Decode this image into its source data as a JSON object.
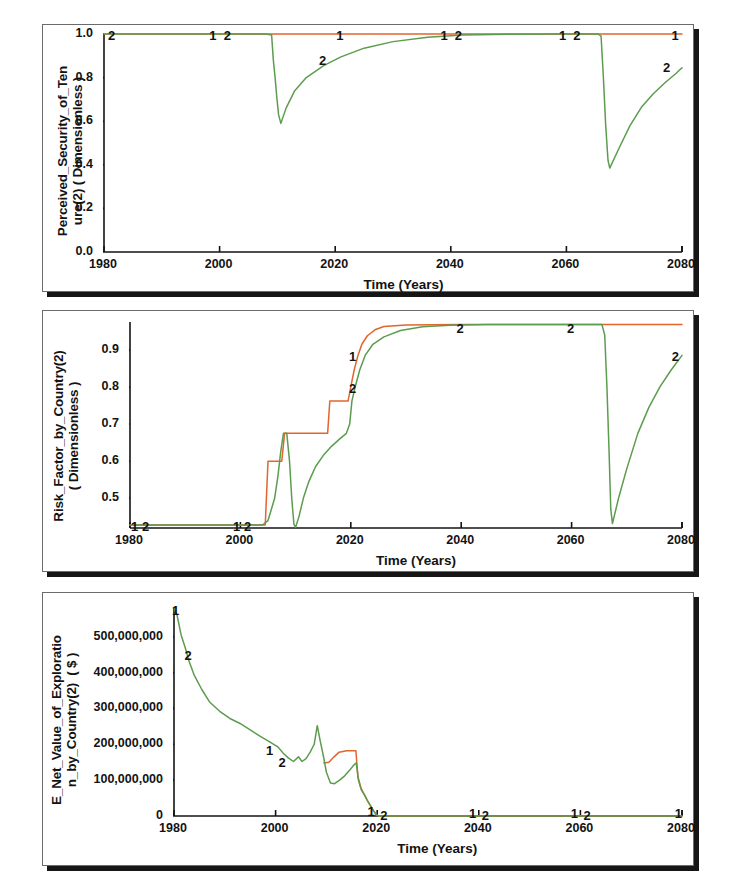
{
  "page": {
    "background": "#ffffff",
    "panel_count": 3
  },
  "colors": {
    "series1": "#e2652c",
    "series2": "#5c9c4e",
    "axis": "#131313",
    "panel_border": "#6b6b6b",
    "panel_shadow": "#161616"
  },
  "chart_data": [
    {
      "type": "line",
      "title": "",
      "ylabel": "Perceived_Security_of_Ten\nure(2) ( Dimensionless )",
      "xlabel": "Time (Years)",
      "xlim": [
        1980,
        2080
      ],
      "ylim": [
        0.0,
        1.0
      ],
      "xticks": [
        1980,
        2000,
        2020,
        2040,
        2060,
        2080
      ],
      "yticks": [
        "0.0",
        "0.2",
        "0.4",
        "0.6",
        "0.8",
        "1.0"
      ],
      "grid": false,
      "legend": "inline-numbered",
      "series": [
        {
          "name": "1",
          "color": "#e2652c",
          "points": [
            [
              1980,
              1.0
            ],
            [
              2000,
              1.0
            ],
            [
              2009,
              1.0
            ],
            [
              2020,
              1.0
            ],
            [
              2040,
              1.0
            ],
            [
              2060,
              1.0
            ],
            [
              2066,
              1.0
            ],
            [
              2080,
              1.0
            ]
          ]
        },
        {
          "name": "2",
          "color": "#5c9c4e",
          "points": [
            [
              1980,
              1.0
            ],
            [
              2000,
              1.0
            ],
            [
              2008,
              1.0
            ],
            [
              2009.0,
              0.995
            ],
            [
              2009.3,
              0.88
            ],
            [
              2009.6,
              0.8
            ],
            [
              2009.9,
              0.71
            ],
            [
              2010.2,
              0.63
            ],
            [
              2010.6,
              0.59
            ],
            [
              2011.5,
              0.66
            ],
            [
              2013,
              0.74
            ],
            [
              2015,
              0.8
            ],
            [
              2018,
              0.855
            ],
            [
              2021,
              0.895
            ],
            [
              2025,
              0.935
            ],
            [
              2030,
              0.965
            ],
            [
              2036,
              0.985
            ],
            [
              2042,
              0.995
            ],
            [
              2050,
              0.999
            ],
            [
              2060,
              1.0
            ],
            [
              2065.5,
              1.0
            ],
            [
              2066.0,
              0.99
            ],
            [
              2066.4,
              0.8
            ],
            [
              2066.8,
              0.58
            ],
            [
              2067.2,
              0.42
            ],
            [
              2067.5,
              0.385
            ],
            [
              2069,
              0.47
            ],
            [
              2071,
              0.58
            ],
            [
              2073,
              0.665
            ],
            [
              2075,
              0.725
            ],
            [
              2077,
              0.775
            ],
            [
              2079,
              0.82
            ],
            [
              2080,
              0.845
            ]
          ]
        }
      ],
      "annotations": [
        {
          "text": "2",
          "x": 1981.5,
          "y": 1.0
        },
        {
          "text": "1",
          "x": 1999.0,
          "y": 1.0
        },
        {
          "text": "2",
          "x": 2001.5,
          "y": 1.0
        },
        {
          "text": "1",
          "x": 2021.0,
          "y": 1.0
        },
        {
          "text": "2",
          "x": 2018.0,
          "y": 0.885
        },
        {
          "text": "1",
          "x": 2039.0,
          "y": 1.0
        },
        {
          "text": "2",
          "x": 2041.5,
          "y": 1.0
        },
        {
          "text": "1",
          "x": 2059.5,
          "y": 1.0
        },
        {
          "text": "2",
          "x": 2062.0,
          "y": 1.0
        },
        {
          "text": "1",
          "x": 2079.0,
          "y": 1.0
        },
        {
          "text": "2",
          "x": 2077.5,
          "y": 0.855
        }
      ]
    },
    {
      "type": "line",
      "title": "",
      "ylabel": "Risk_Factor_by_Country(2)\n( Dimensionless )",
      "xlabel": "Time (Years)",
      "xlim": [
        1980,
        2080
      ],
      "ylim": [
        0.42,
        0.975
      ],
      "xticks": [
        1980,
        2000,
        2020,
        2040,
        2060,
        2080
      ],
      "yticks": [
        "0.5",
        "0.6",
        "0.7",
        "0.8",
        "0.9"
      ],
      "grid": false,
      "legend": "inline-numbered",
      "series": [
        {
          "name": "1",
          "color": "#e2652c",
          "points": [
            [
              1980,
              0.428
            ],
            [
              2000,
              0.428
            ],
            [
              2004.5,
              0.428
            ],
            [
              2005,
              0.6
            ],
            [
              2007.5,
              0.6
            ],
            [
              2008,
              0.675
            ],
            [
              2015.8,
              0.675
            ],
            [
              2016.2,
              0.762
            ],
            [
              2019.5,
              0.762
            ],
            [
              2020,
              0.8
            ],
            [
              2020.6,
              0.845
            ],
            [
              2021.3,
              0.885
            ],
            [
              2022,
              0.915
            ],
            [
              2023,
              0.938
            ],
            [
              2024.5,
              0.955
            ],
            [
              2026,
              0.963
            ],
            [
              2030,
              0.967
            ],
            [
              2040,
              0.968
            ],
            [
              2060,
              0.968
            ],
            [
              2080,
              0.968
            ]
          ]
        },
        {
          "name": "2",
          "color": "#5c9c4e",
          "points": [
            [
              1980,
              0.428
            ],
            [
              2000,
              0.428
            ],
            [
              2004,
              0.428
            ],
            [
              2005,
              0.44
            ],
            [
              2005.6,
              0.47
            ],
            [
              2006.2,
              0.5
            ],
            [
              2006.8,
              0.56
            ],
            [
              2007.3,
              0.625
            ],
            [
              2007.8,
              0.675
            ],
            [
              2008.4,
              0.675
            ],
            [
              2008.9,
              0.6
            ],
            [
              2009.3,
              0.5
            ],
            [
              2009.7,
              0.43
            ],
            [
              2010.0,
              0.422
            ],
            [
              2010.6,
              0.45
            ],
            [
              2011.4,
              0.5
            ],
            [
              2012.4,
              0.545
            ],
            [
              2013.6,
              0.585
            ],
            [
              2015,
              0.615
            ],
            [
              2016.5,
              0.64
            ],
            [
              2018,
              0.66
            ],
            [
              2019.2,
              0.675
            ],
            [
              2019.8,
              0.7
            ],
            [
              2020.2,
              0.762
            ],
            [
              2020.8,
              0.8
            ],
            [
              2021.6,
              0.845
            ],
            [
              2022.6,
              0.885
            ],
            [
              2024,
              0.915
            ],
            [
              2026,
              0.935
            ],
            [
              2029,
              0.952
            ],
            [
              2033,
              0.962
            ],
            [
              2038,
              0.966
            ],
            [
              2045,
              0.968
            ],
            [
              2055,
              0.968
            ],
            [
              2065.5,
              0.968
            ],
            [
              2066.0,
              0.94
            ],
            [
              2066.4,
              0.8
            ],
            [
              2066.8,
              0.62
            ],
            [
              2067.1,
              0.47
            ],
            [
              2067.4,
              0.432
            ],
            [
              2068.5,
              0.5
            ],
            [
              2070,
              0.58
            ],
            [
              2072,
              0.675
            ],
            [
              2074,
              0.745
            ],
            [
              2076,
              0.8
            ],
            [
              2078,
              0.845
            ],
            [
              2080,
              0.885
            ]
          ]
        }
      ],
      "annotations": [
        {
          "text": "1",
          "x": 1981.0,
          "y": 0.428
        },
        {
          "text": "2",
          "x": 1983.0,
          "y": 0.428
        },
        {
          "text": "1",
          "x": 1999.5,
          "y": 0.428
        },
        {
          "text": "2",
          "x": 2001.5,
          "y": 0.428
        },
        {
          "text": "1",
          "x": 2020.5,
          "y": 0.885
        },
        {
          "text": "2",
          "x": 2020.5,
          "y": 0.8
        },
        {
          "text": "2",
          "x": 2040.0,
          "y": 0.962
        },
        {
          "text": "2",
          "x": 2060.0,
          "y": 0.962
        },
        {
          "text": "2",
          "x": 2079.0,
          "y": 0.885
        }
      ]
    },
    {
      "type": "line",
      "title": "",
      "ylabel": "E_Net_Value_of_Exploratio\nn_by_Country(2)  ( $ )",
      "xlabel": "Time (Years)",
      "xlim": [
        1980,
        2080
      ],
      "ylim": [
        0,
        580000000
      ],
      "xticks": [
        1980,
        2000,
        2020,
        2040,
        2060,
        2080
      ],
      "yticks": [
        "0",
        "100,000,000",
        "200,000,000",
        "300,000,000",
        "400,000,000",
        "500,000,000"
      ],
      "grid": false,
      "legend": "inline-numbered",
      "series": [
        {
          "name": "1",
          "color": "#e2652c",
          "points": [
            [
              2009.5,
              148000000
            ],
            [
              2010.5,
              150000000
            ],
            [
              2011.5,
              165000000
            ],
            [
              2012.5,
              178000000
            ],
            [
              2014,
              182000000
            ],
            [
              2015.8,
              182000000
            ],
            [
              2016.2,
              110000000
            ],
            [
              2016.8,
              78000000
            ],
            [
              2017.4,
              62000000
            ],
            [
              2018.0,
              45000000
            ],
            [
              2018.6,
              30000000
            ],
            [
              2019.2,
              16000000
            ],
            [
              2019.8,
              4000000
            ],
            [
              2020.2,
              0
            ],
            [
              2040,
              0
            ],
            [
              2060,
              0
            ],
            [
              2080,
              0
            ]
          ]
        },
        {
          "name": "2",
          "color": "#5c9c4e",
          "points": [
            [
              1980,
              580000000
            ],
            [
              1980.6,
              560000000
            ],
            [
              1981.4,
              505000000
            ],
            [
              1982.2,
              470000000
            ],
            [
              1983,
              430000000
            ],
            [
              1984,
              392000000
            ],
            [
              1985.5,
              352000000
            ],
            [
              1987,
              318000000
            ],
            [
              1989,
              292000000
            ],
            [
              1991,
              272000000
            ],
            [
              1993,
              258000000
            ],
            [
              1995,
              240000000
            ],
            [
              1997,
              222000000
            ],
            [
              1999,
              205000000
            ],
            [
              2000.5,
              192000000
            ],
            [
              2001.5,
              175000000
            ],
            [
              2002.5,
              162000000
            ],
            [
              2003.5,
              152000000
            ],
            [
              2004.5,
              165000000
            ],
            [
              2005.2,
              152000000
            ],
            [
              2006,
              160000000
            ],
            [
              2006.8,
              178000000
            ],
            [
              2007.6,
              200000000
            ],
            [
              2008.2,
              252000000
            ],
            [
              2008.8,
              208000000
            ],
            [
              2009.4,
              168000000
            ],
            [
              2010,
              122000000
            ],
            [
              2010.8,
              92000000
            ],
            [
              2011.6,
              90000000
            ],
            [
              2012.6,
              100000000
            ],
            [
              2013.6,
              112000000
            ],
            [
              2014.6,
              128000000
            ],
            [
              2015.4,
              142000000
            ],
            [
              2015.9,
              148000000
            ],
            [
              2016.3,
              100000000
            ],
            [
              2016.9,
              72000000
            ],
            [
              2017.5,
              58000000
            ],
            [
              2018.1,
              42000000
            ],
            [
              2018.7,
              28000000
            ],
            [
              2019.3,
              14000000
            ],
            [
              2019.9,
              3000000
            ],
            [
              2020.3,
              0
            ],
            [
              2040,
              0
            ],
            [
              2060,
              0
            ],
            [
              2080,
              0
            ]
          ]
        }
      ],
      "annotations": [
        {
          "text": "1",
          "x": 1980.5,
          "y": 578000000
        },
        {
          "text": "2",
          "x": 1983.0,
          "y": 452000000
        },
        {
          "text": "1",
          "x": 1999.0,
          "y": 188000000
        },
        {
          "text": "2",
          "x": 2001.5,
          "y": 152000000
        },
        {
          "text": "1",
          "x": 2019.0,
          "y": 16000000
        },
        {
          "text": "2",
          "x": 2021.5,
          "y": 6000000
        },
        {
          "text": "1",
          "x": 2039.0,
          "y": 10000000
        },
        {
          "text": "2",
          "x": 2041.5,
          "y": 6000000
        },
        {
          "text": "1",
          "x": 2059.0,
          "y": 10000000
        },
        {
          "text": "2",
          "x": 2061.5,
          "y": 6000000
        },
        {
          "text": "1",
          "x": 2079.5,
          "y": 10000000
        }
      ]
    }
  ]
}
